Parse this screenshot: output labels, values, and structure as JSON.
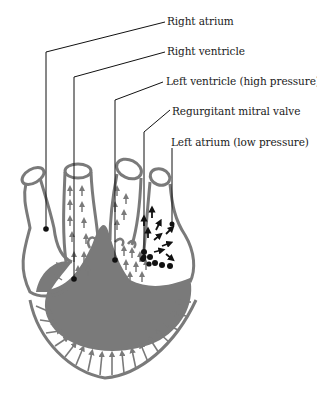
{
  "figure": {
    "colors": {
      "tissue": "#7a7a7a",
      "leader_line": "#111111",
      "black_flow": "#111111",
      "background": "#ffffff"
    },
    "labels": [
      {
        "id": "right-atrium",
        "text": "Right atrium"
      },
      {
        "id": "right-ventricle",
        "text": "Right ventricle"
      },
      {
        "id": "left-ventricle",
        "text": "Left ventricle (high pressure)"
      },
      {
        "id": "regurgitant-mitral-valve",
        "text": "Regurgitant mitral valve"
      },
      {
        "id": "left-atrium",
        "text": "Left atrium (low pressure)"
      }
    ]
  }
}
